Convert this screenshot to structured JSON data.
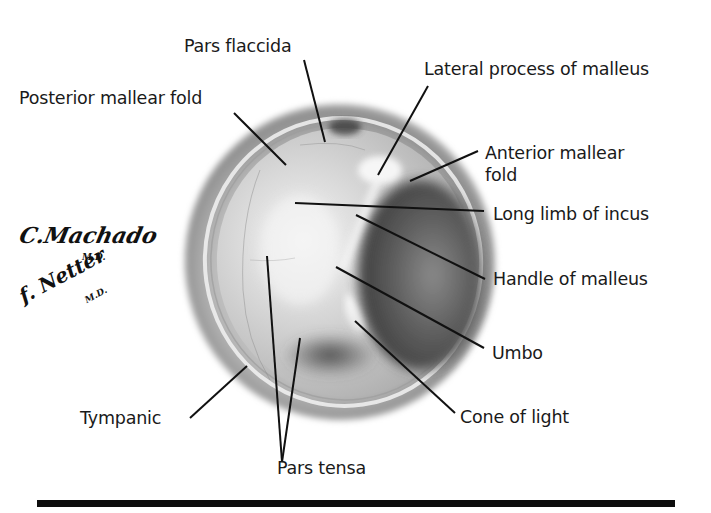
{
  "figure": {
    "labels": {
      "pars_flaccida": "Pars flaccida",
      "lateral_process": "Lateral process of malleus",
      "posterior_mallear_fold": "Posterior mallear fold",
      "anterior_mallear_fold_line1": "Anterior mallear",
      "anterior_mallear_fold_line2": "fold",
      "long_limb_incus": "Long limb of incus",
      "handle_malleus": "Handle of malleus",
      "umbo": "Umbo",
      "cone_of_light": "Cone of light",
      "tympanic": "Tympanic",
      "pars_tensa": "Pars tensa"
    },
    "signatures": {
      "machado": "C.Machado",
      "machado_md": "M.D.",
      "netter": "f. Netter",
      "netter_md": "M.D."
    },
    "colors": {
      "background": "#ffffff",
      "label_text": "#1a1a1a",
      "leader_line": "#111111",
      "membrane_light": "#ececec",
      "membrane_mid": "#a8a8a8",
      "membrane_dark": "#4a4a4a",
      "rule": "#0d0d0d"
    }
  }
}
